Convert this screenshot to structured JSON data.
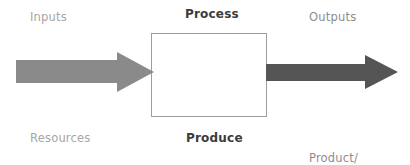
{
  "diagram": {
    "background_color": "#ffffff",
    "labels": {
      "inputs": "Inputs",
      "process": "Process",
      "outputs": "Outputs",
      "resources": "Resources",
      "produce": "Produce",
      "product_line1": "Product/",
      "product_line2": "Service",
      "product_service": "Product/\nService"
    },
    "colors": {
      "muted_text": "#a6a6a6",
      "mid_text": "#8d8d8d",
      "strong_text": "#3b3b3b",
      "box_border": "#9d9d9d",
      "box_fill": "#ffffff",
      "input_arrow": "#8a8a8a",
      "output_arrow": "#555555"
    },
    "shapes": {
      "process_box": {
        "x": 151,
        "y": 33,
        "width": 116,
        "height": 84
      },
      "input_arrow": {
        "name": "input-arrow",
        "direction": "right",
        "x": 16,
        "y": 50,
        "width": 138,
        "height": 44,
        "color": "#8a8a8a"
      },
      "output_arrow": {
        "name": "output-arrow",
        "direction": "right",
        "x": 266,
        "y": 53,
        "width": 132,
        "height": 38,
        "color": "#555555"
      }
    }
  }
}
